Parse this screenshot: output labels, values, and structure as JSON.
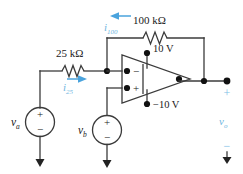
{
  "figure": {
    "type": "circuit-schematic",
    "colors": {
      "wire": "#3b3b3b",
      "node": "#111111",
      "text": "#1a1a1a",
      "accent_blue": "#4aa3dd",
      "label_blue": "#6fb6e0",
      "background": "#ffffff"
    }
  },
  "components": {
    "resistor_feedback": {
      "name": "100 kΩ feedback resistor",
      "label": "100 kΩ",
      "value": "100",
      "unit": "kΩ"
    },
    "resistor_input": {
      "name": "25 kΩ input resistor",
      "label": "25 kΩ",
      "value": "25",
      "unit": "kΩ"
    },
    "source_a": {
      "name": "independent voltage source a",
      "label": "v",
      "subscript": "a",
      "plus": "+",
      "minus": "−"
    },
    "source_b": {
      "name": "independent voltage source b",
      "label": "v",
      "subscript": "b",
      "plus": "+",
      "minus": "−"
    },
    "opamp": {
      "name": "operational amplifier",
      "inverting_input": "−",
      "noninverting_input": "+",
      "rail_positive": "10 V",
      "rail_negative": "−10 V"
    }
  },
  "currents": {
    "i_feedback": {
      "label": "i",
      "subscript": "100",
      "direction": "left"
    },
    "i_input": {
      "label": "i",
      "subscript": "25",
      "direction": "right"
    }
  },
  "output": {
    "label": "v",
    "subscript": "o",
    "plus": "+",
    "minus": "−"
  }
}
